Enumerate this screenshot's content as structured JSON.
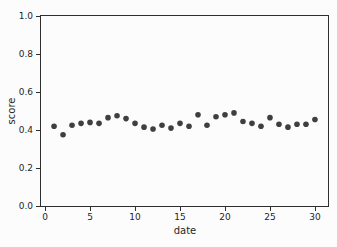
{
  "chart_data": {
    "type": "scatter",
    "title": "",
    "xlabel": "date",
    "ylabel": "score",
    "x": [
      1,
      2,
      3,
      4,
      5,
      6,
      7,
      8,
      9,
      10,
      11,
      12,
      13,
      14,
      15,
      16,
      17,
      18,
      19,
      20,
      21,
      22,
      23,
      24,
      25,
      26,
      27,
      28,
      29,
      30
    ],
    "y": [
      0.42,
      0.375,
      0.425,
      0.435,
      0.44,
      0.435,
      0.465,
      0.475,
      0.46,
      0.435,
      0.415,
      0.405,
      0.425,
      0.41,
      0.435,
      0.42,
      0.48,
      0.425,
      0.47,
      0.48,
      0.49,
      0.445,
      0.435,
      0.42,
      0.465,
      0.43,
      0.415,
      0.43,
      0.43,
      0.455
    ],
    "xlim": [
      -0.45,
      31.45
    ],
    "ylim": [
      0,
      1
    ],
    "xticks": [
      0,
      5,
      10,
      15,
      20,
      25,
      30
    ],
    "yticks": [
      0.0,
      0.2,
      0.4,
      0.6,
      0.8,
      1.0
    ],
    "ytick_decimals": 1,
    "grid": false,
    "legend": null,
    "marker_color": "#3f3f3f",
    "axis_color": "#2e2e2e",
    "text_color": "#262626",
    "background_color": "#fcfcfc"
  }
}
